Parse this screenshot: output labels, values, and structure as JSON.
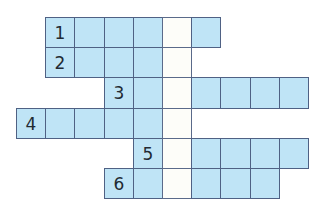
{
  "puzzle": {
    "type": "crossword",
    "colors": {
      "cell_fill": "#bfe4f6",
      "key_column_fill": "#fdfdf9",
      "border": "#4f6184"
    },
    "layout": {
      "origin_x": 16,
      "origin_y": 17,
      "cell_width": 29.2,
      "cell_height": 30.2
    },
    "key_column": 5,
    "rows": [
      {
        "number": "1",
        "start_col": 1,
        "length": 6
      },
      {
        "number": "2",
        "start_col": 1,
        "length": 5
      },
      {
        "number": "3",
        "start_col": 3,
        "length": 7
      },
      {
        "number": "4",
        "start_col": 0,
        "length": 6
      },
      {
        "number": "5",
        "start_col": 4,
        "length": 6
      },
      {
        "number": "6",
        "start_col": 3,
        "length": 6
      }
    ]
  }
}
